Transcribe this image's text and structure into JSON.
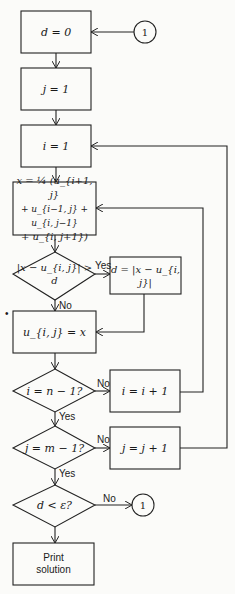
{
  "diagram": {
    "type": "flowchart",
    "nodes": {
      "init_d": "d = 0",
      "init_j": "j = 1",
      "init_i": "i = 1",
      "update_x_line1": "x = ¼ (u_{i+1, j}",
      "update_x_line2": "+ u_{i−1, j} + u_{i, j−1}",
      "update_x_line3": "+ u_{i, j+1})",
      "check_diff": "|x − u_{i, j}| > d",
      "set_d": "d = |x − u_{i, j}|",
      "assign_u": "u_{i, j} = x",
      "check_i": "i = n − 1?",
      "inc_i": "i = i + 1",
      "check_j": "j = m − 1?",
      "inc_j": "j = j + 1",
      "check_converge": "d < ε?",
      "print_line1": "Print",
      "print_line2": "solution"
    },
    "connectors": {
      "top": "1",
      "bottom": "1"
    },
    "edge_labels": {
      "diff_yes": "Yes",
      "diff_no": "No",
      "i_no": "No",
      "i_yes": "Yes",
      "j_no": "No",
      "j_yes": "Yes",
      "conv_no": "No"
    },
    "marker": "•"
  }
}
